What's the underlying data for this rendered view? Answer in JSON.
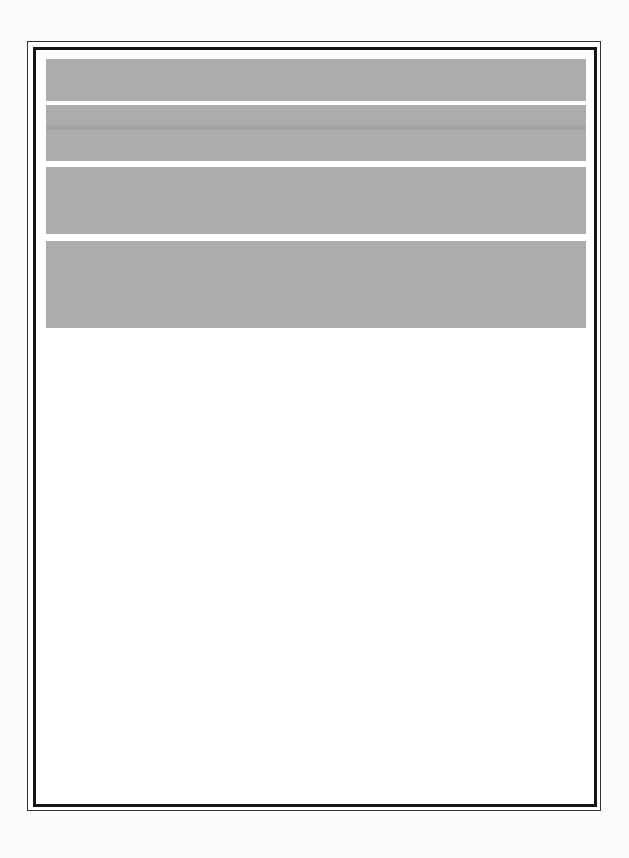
{
  "page": {
    "type": "scanned-form",
    "background": "#fbfbfb",
    "frame": {
      "outer_border_color": "#333333",
      "inner_border_color": "#151515"
    },
    "blocks": [
      {
        "id": "block-1",
        "fill": "#acacac",
        "text": ""
      },
      {
        "id": "block-2",
        "fill": "#acacac",
        "text": ""
      },
      {
        "id": "block-3",
        "fill": "#acacac",
        "text": ""
      },
      {
        "id": "block-4",
        "fill": "#acacac",
        "text": ""
      }
    ]
  }
}
